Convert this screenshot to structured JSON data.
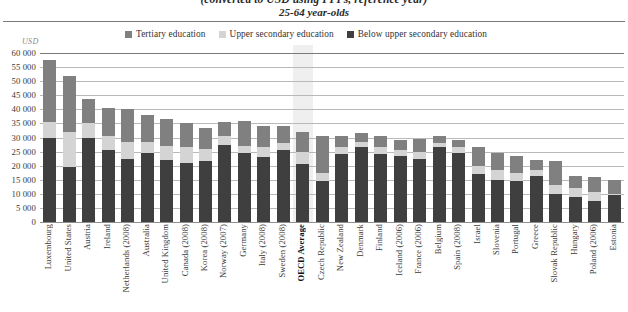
{
  "title": {
    "line1": "(converted to USD using PPPs, reference year)",
    "line2": "25-64 year-olds"
  },
  "axis": {
    "unit": "USD",
    "y_ticks": [
      "60 000",
      "55 000",
      "50 000",
      "45 000",
      "40 000",
      "35 000",
      "30 000",
      "25 000",
      "20 000",
      "15 000",
      "10 000",
      "5 000",
      "0"
    ]
  },
  "legend": {
    "items": [
      {
        "label": "Tertiary education",
        "color": "#808080",
        "key": "tertiary"
      },
      {
        "label": "Upper secondary education",
        "color": "#d4d4d4",
        "key": "upper_secondary"
      },
      {
        "label": "Below upper secondary education",
        "color": "#3f3f3f",
        "key": "below_upper_secondary"
      }
    ]
  },
  "chart_data": {
    "type": "bar",
    "stacked": true,
    "title": "(converted to USD using PPPs, reference year)",
    "subtitle": "25-64 year-olds",
    "xlabel": "",
    "ylabel": "USD",
    "ylim": [
      0,
      60000
    ],
    "ytick_step": 5000,
    "grid": true,
    "legend_position": "top",
    "highlight_category": "OECD Average",
    "categories": [
      "Luxembourg",
      "United States",
      "Austria",
      "Ireland",
      "Netherlands (2008)",
      "Australia",
      "United Kingdom",
      "Canada (2008)",
      "Korea (2008)",
      "Norway (2007)",
      "Germany",
      "Italy (2008)",
      "Sweden (2008)",
      "OECD Average",
      "Czech Republic",
      "New Zealand",
      "Denmark",
      "Finland",
      "Iceland (2006)",
      "France (2006)",
      "Belgium",
      "Spain (2008)",
      "Israel",
      "Slovenia",
      "Portugal",
      "Greece",
      "Slovak Republic",
      "Hungary",
      "Poland (2006)",
      "Estonia"
    ],
    "series": [
      {
        "name": "Below upper secondary education",
        "color": "#3f3f3f",
        "values": [
          30000,
          19500,
          30000,
          25500,
          22500,
          24500,
          22000,
          21000,
          21500,
          27500,
          24500,
          23000,
          25500,
          20500,
          14500,
          24000,
          26500,
          24000,
          23500,
          22500,
          26500,
          24500,
          17000,
          15000,
          14500,
          16500,
          10000,
          9000,
          7500,
          9500
        ]
      },
      {
        "name": "Upper secondary education",
        "color": "#d4d4d4",
        "values": [
          5500,
          12500,
          5000,
          5000,
          6000,
          4000,
          5000,
          5500,
          4500,
          3000,
          2500,
          3500,
          2500,
          4500,
          3000,
          2500,
          2000,
          2500,
          2000,
          2500,
          1500,
          2000,
          3000,
          3500,
          3000,
          2000,
          3000,
          3000,
          3000,
          500
        ]
      },
      {
        "name": "Tertiary education",
        "color": "#808080",
        "values": [
          22000,
          20000,
          8500,
          10000,
          11500,
          9500,
          9500,
          8500,
          7500,
          5000,
          9000,
          7500,
          6000,
          7000,
          13000,
          4000,
          3000,
          4000,
          3500,
          4500,
          2500,
          2500,
          6500,
          6000,
          6000,
          3500,
          8500,
          4500,
          5500,
          5000
        ]
      }
    ],
    "totals": [
      57500,
      52000,
      43500,
      40500,
      40000,
      38000,
      36500,
      35000,
      33500,
      35500,
      36000,
      34000,
      34000,
      32000,
      30500,
      30500,
      31500,
      30500,
      29000,
      29500,
      30500,
      29000,
      26500,
      24500,
      23500,
      22000,
      21500,
      16500,
      16000,
      15000
    ]
  }
}
